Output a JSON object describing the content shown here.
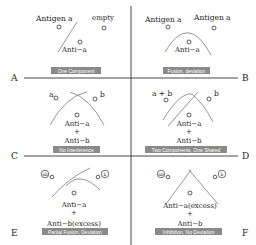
{
  "figure": {
    "dividers": {
      "vertical_x": 131,
      "horizontal_y": [
        78,
        156
      ]
    }
  },
  "panels": [
    {
      "id": "A",
      "side_label": "A",
      "antigen_left": "Antigen a",
      "antigen_right": "empty",
      "antibody": [
        "Anti−a"
      ],
      "caption": "One Component"
    },
    {
      "id": "B",
      "side_label": "B",
      "antigen_left": "Antigen a",
      "antigen_right": "Antigen a",
      "antibody": [
        "Anti−a"
      ],
      "caption": "Fusion, deviation"
    },
    {
      "id": "C",
      "side_label": "C",
      "antigen_left": "a",
      "antigen_right": "b",
      "antibody": [
        "Anti−a",
        "+",
        "Anti−b"
      ],
      "caption": "No Interference"
    },
    {
      "id": "D",
      "side_label": "D",
      "antigen_left": "a + b",
      "antigen_right": "b",
      "antibody": [
        "Anti−a",
        "+",
        "Anti−b"
      ],
      "caption": "Two Components, One Shared"
    },
    {
      "id": "E",
      "side_label": "E",
      "antigen_left": "ab",
      "antigen_right": "b",
      "antibody": [
        "Anti−a",
        "+",
        "Anti−b(excess)"
      ],
      "caption": "Partial Fusion, Deviation"
    },
    {
      "id": "F",
      "side_label": "F",
      "antigen_left": "ab",
      "antigen_right": "b",
      "antibody": [
        "Anti−a(excess)",
        "+",
        "Anti−b"
      ],
      "caption": "Inhibition, No Deviation"
    }
  ]
}
